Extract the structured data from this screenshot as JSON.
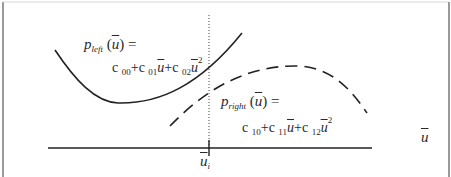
{
  "diagram": {
    "type": "piecewise-quadratic-fit",
    "left_curve": {
      "name": "p_left",
      "label_func": "p",
      "label_sub": "left",
      "label_arg": "u",
      "equals": "=",
      "style": "solid",
      "equation": {
        "c0": "c",
        "c0_sub": "00",
        "plus1": "+",
        "c1": "c",
        "c1_sub": "01",
        "var1": "u",
        "plus2": "+",
        "c2": "c",
        "c2_sub": "02",
        "var2": "u",
        "exp": "2"
      }
    },
    "right_curve": {
      "name": "p_right",
      "label_func": "p",
      "label_sub": "right",
      "label_arg": "u",
      "equals": "=",
      "style": "dashed",
      "equation": {
        "c0": "c",
        "c0_sub": "10",
        "plus1": "+",
        "c1": "c",
        "c1_sub": "11",
        "var1": "u",
        "plus2": "+",
        "c2": "c",
        "c2_sub": "12",
        "var2": "u",
        "exp": "2"
      }
    },
    "x_axis": {
      "label": "u"
    },
    "split_point": {
      "label": "u",
      "label_sub": "i",
      "style": "dotted"
    },
    "colors": {
      "line": "#222222",
      "frame": "#9a9a9a",
      "text": "#2a2a2a",
      "background": "#ffffff"
    }
  }
}
